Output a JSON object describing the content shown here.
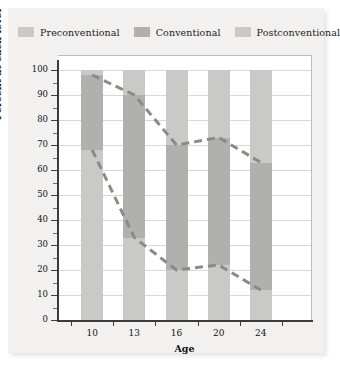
{
  "legend": {
    "items": [
      {
        "label": "Preconventional",
        "color": "#c9c9c7"
      },
      {
        "label": "Conventional",
        "color": "#b0b0ae"
      },
      {
        "label": "Postconventional",
        "color": "#c9c9c7"
      }
    ]
  },
  "chart_data": {
    "type": "bar",
    "title": "",
    "subtitle": "",
    "xlabel": "Age",
    "ylabel": "Percent at each level",
    "categories": [
      "10",
      "13",
      "16",
      "20",
      "24"
    ],
    "xtick_labels": [
      "10",
      "13",
      "16",
      "20",
      "24"
    ],
    "ytick_labels": [
      "0",
      "10",
      "20",
      "30",
      "40",
      "50",
      "60",
      "70",
      "80",
      "90",
      "100"
    ],
    "ylim": [
      0,
      100
    ],
    "ytick_step": 10,
    "grid": true,
    "stacked": true,
    "legend_position": "top",
    "series": [
      {
        "name": "Preconventional",
        "color": "#c9c9c7",
        "values": [
          68,
          33,
          20,
          22,
          12
        ]
      },
      {
        "name": "Conventional",
        "color": "#b0b0ae",
        "values": [
          30,
          57,
          50,
          51,
          51
        ]
      },
      {
        "name": "Postconventional",
        "color": "#c9c9c7",
        "values": [
          2,
          10,
          30,
          27,
          37
        ]
      }
    ],
    "boundary_lines": [
      {
        "name": "Conventional upper boundary",
        "values": [
          98,
          90,
          70,
          73,
          63
        ],
        "style": "dashed",
        "color": "#8a8a88"
      },
      {
        "name": "Preconventional upper boundary",
        "values": [
          68,
          33,
          20,
          22,
          12
        ],
        "style": "dashed",
        "color": "#8a8a88"
      }
    ],
    "bar_top": 100
  },
  "colors": {
    "panel_background": "#f2f1ef",
    "plot_background": "#ffffff",
    "gridline": "#d8d8d8",
    "axis": "#3b3b3b",
    "text": "#111111",
    "dash_line": "#8a8a88"
  }
}
